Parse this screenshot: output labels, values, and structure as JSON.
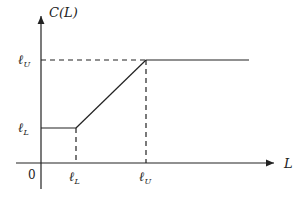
{
  "diagram": {
    "type": "piecewise-linear function plot",
    "y_axis_label": "C(L)",
    "x_axis_label": "L",
    "origin_label": "0",
    "x_ticks": [
      {
        "symbol": "ℓ",
        "subscript": "L"
      },
      {
        "symbol": "ℓ",
        "subscript": "U"
      }
    ],
    "y_ticks": [
      {
        "symbol": "ℓ",
        "subscript": "L"
      },
      {
        "symbol": "ℓ",
        "subscript": "U"
      }
    ],
    "segments": [
      {
        "description": "constant at ℓ_L for L ≤ ℓ_L"
      },
      {
        "description": "linear increase from (ℓ_L, ℓ_L) to (ℓ_U, ℓ_U)"
      },
      {
        "description": "constant at ℓ_U for L ≥ ℓ_U"
      }
    ],
    "colors": {
      "line": "#222222",
      "background": "#ffffff"
    }
  }
}
